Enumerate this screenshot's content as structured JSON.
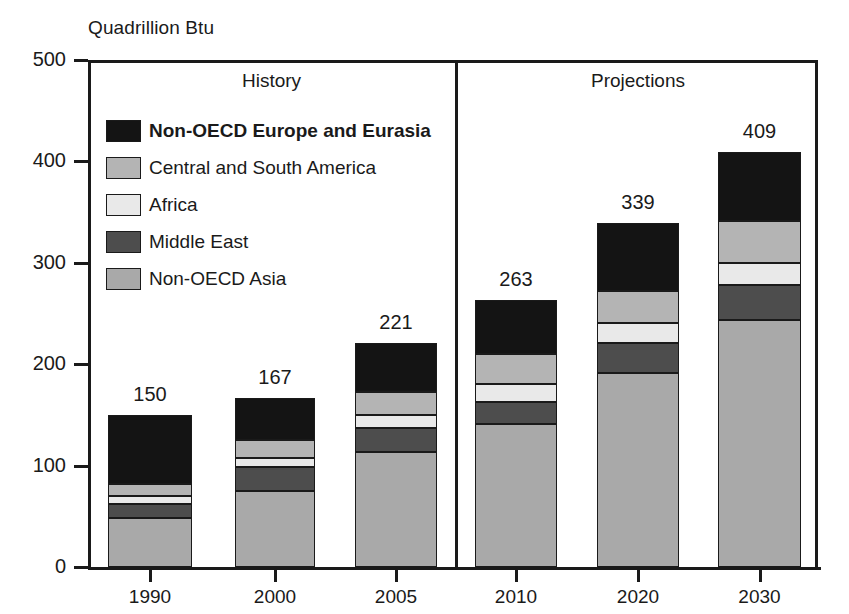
{
  "chart_data": {
    "type": "bar",
    "subtype": "stacked-bar",
    "title": "",
    "ylabel": "Quadrillion Btu",
    "xlabel": "",
    "ylim": [
      0,
      500
    ],
    "yticks": [
      0,
      100,
      200,
      300,
      400,
      500
    ],
    "grid": false,
    "legend_position": "inside-upper-left",
    "categories": [
      "1990",
      "2000",
      "2005",
      "2010",
      "2020",
      "2030"
    ],
    "totals": [
      150,
      167,
      221,
      263,
      339,
      409
    ],
    "series": [
      {
        "name": "Non-OECD Asia",
        "color": "#a9a9a9",
        "values": [
          48,
          75,
          113,
          141,
          191,
          244
        ]
      },
      {
        "name": "Middle East",
        "color": "#4d4d4d",
        "values": [
          14,
          24,
          24,
          22,
          30,
          34
        ]
      },
      {
        "name": "Africa",
        "color": "#e9e9e9",
        "values": [
          8,
          8,
          13,
          17,
          20,
          22
        ]
      },
      {
        "name": "Central and South America",
        "color": "#b4b4b4",
        "values": [
          12,
          18,
          23,
          30,
          31,
          41
        ]
      },
      {
        "name": "Non-OECD Europe and Eurasia",
        "color": "#141414",
        "values": [
          68,
          42,
          48,
          53,
          67,
          68
        ]
      }
    ],
    "cumulative_tops": {
      "1990": [
        48,
        62,
        70,
        82,
        150
      ],
      "2000": [
        75,
        99,
        107,
        125,
        167
      ],
      "2005": [
        113,
        137,
        150,
        173,
        221
      ],
      "2010": [
        141,
        163,
        180,
        210,
        263
      ],
      "2020": [
        191,
        221,
        241,
        272,
        339
      ],
      "2030": [
        244,
        278,
        300,
        341,
        409
      ]
    },
    "annotations": [
      {
        "text": "History",
        "section": "left"
      },
      {
        "text": "Projections",
        "section": "right"
      }
    ]
  },
  "legend": {
    "items": [
      {
        "label": "Non-OECD Europe and Eurasia",
        "color": "#141414",
        "bold": true
      },
      {
        "label": "Central and South America",
        "color": "#b4b4b4",
        "bold": false
      },
      {
        "label": "Africa",
        "color": "#e9e9e9",
        "bold": false
      },
      {
        "label": "Middle East",
        "color": "#4d4d4d",
        "bold": false
      },
      {
        "label": "Non-OECD Asia",
        "color": "#a9a9a9",
        "bold": false
      }
    ]
  },
  "axis": {
    "y_title": "Quadrillion Btu",
    "y_tick_labels": [
      "500",
      "400",
      "300",
      "200",
      "100",
      "0"
    ],
    "x_tick_labels": [
      "1990",
      "2000",
      "2005",
      "2010",
      "2020",
      "2030"
    ]
  },
  "sections": {
    "history_label": "History",
    "projections_label": "Projections"
  },
  "bar_value_labels": [
    "150",
    "167",
    "221",
    "263",
    "339",
    "409"
  ]
}
